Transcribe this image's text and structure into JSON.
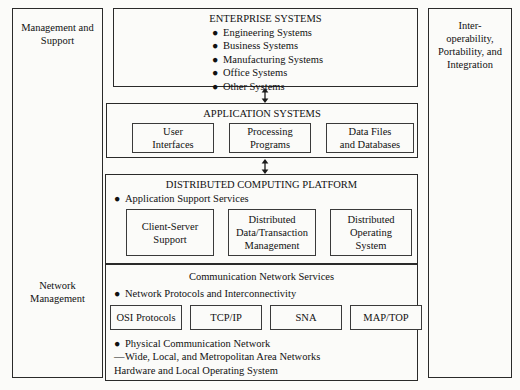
{
  "diagram": {
    "left_sidebar": {
      "top_label": "Management and\nSupport",
      "middle_label": "Network\nManagement"
    },
    "right_sidebar": {
      "label": "Inter-\noperability,\nPortability, and\nIntegration"
    },
    "enterprise": {
      "title": "ENTERPRISE SYSTEMS",
      "items": [
        "Engineering Systems",
        "Business Systems",
        "Manufacturing Systems",
        "Office Systems",
        "Other Systems"
      ]
    },
    "application": {
      "title": "APPLICATION SYSTEMS",
      "boxes": [
        "User\nInterfaces",
        "Processing\nPrograms",
        "Data Files\nand Databases"
      ]
    },
    "platform": {
      "title": "DISTRIBUTED COMPUTING PLATFORM",
      "services_label": "Application Support Services",
      "boxes": [
        "Client-Server\nSupport",
        "Distributed\nData/Transaction\nManagement",
        "Distributed\nOperating\nSystem"
      ]
    },
    "network": {
      "title": "Communication Network Services",
      "protocols_label": "Network Protocols and Interconnectivity",
      "protocol_boxes": [
        "OSI Protocols",
        "TCP/IP",
        "SNA",
        "MAP/TOP"
      ],
      "physical_label": "Physical Communication Network",
      "physical_detail": "Wide, Local, and Metropolitan Area Networks",
      "hardware_label": "Hardware and Local Operating System"
    },
    "connectors": [
      {
        "name": "enterprise-application-arrow"
      },
      {
        "name": "application-platform-arrow"
      }
    ],
    "glyphs": {
      "bullet": "●",
      "dash": "—"
    },
    "colors": {
      "border": "#2a2a2a",
      "background": "#fbfbf9",
      "text": "#111111"
    }
  }
}
